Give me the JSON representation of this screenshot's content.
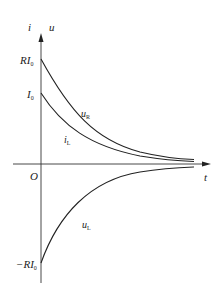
{
  "diagram": {
    "type": "exponential-decay-plot",
    "axes": {
      "vertical_labels": [
        "i",
        "u"
      ],
      "horizontal_label": "t",
      "origin_label": "O"
    },
    "tick_labels": {
      "RI0": {
        "main": "RI",
        "sub": "0"
      },
      "I0": {
        "main": "I",
        "sub": "0"
      },
      "neg_RI0": {
        "main": "−RI",
        "sub": "0"
      }
    },
    "curves": [
      {
        "name": "uR",
        "main": "u",
        "sub": "R",
        "start": "RI0",
        "trend": "decays to 0"
      },
      {
        "name": "iL",
        "main": "i",
        "sub": "L",
        "start": "I0",
        "trend": "decays to 0"
      },
      {
        "name": "uL",
        "main": "u",
        "sub": "L",
        "start": "-RI0",
        "trend": "rises to 0"
      }
    ],
    "colors": {
      "line": "#222222",
      "background": "#ffffff"
    }
  }
}
